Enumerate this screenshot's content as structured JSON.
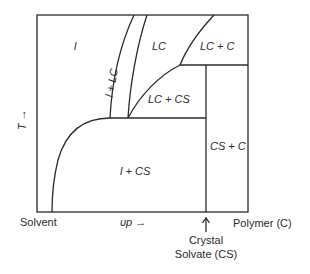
{
  "diagram": {
    "type": "phase-diagram",
    "y_axis_label": "T →",
    "x_axis_label": "υp →",
    "regions": {
      "isotropic": "l",
      "isotropic_lc": "l + LC",
      "lc": "LC",
      "lc_c": "LC + C",
      "lc_cs": "LC + CS",
      "isotropic_cs": "l + CS",
      "cs_c": "CS + C"
    },
    "x_endpoints": {
      "left": "Solvent",
      "right": "Polymer (C)",
      "marker_arrow": "↑",
      "marker_line1": "Crystal",
      "marker_line2": "Solvate (CS)"
    },
    "line_color": "#2a2a2a"
  }
}
